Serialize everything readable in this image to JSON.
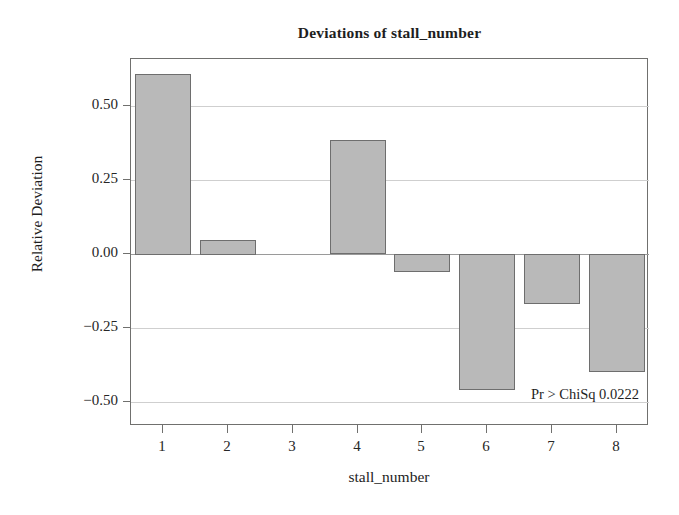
{
  "chart_data": {
    "type": "bar",
    "title": "Deviations of stall_number",
    "xlabel": "stall_number",
    "ylabel": "Relative Deviation",
    "categories": [
      "1",
      "2",
      "3",
      "4",
      "5",
      "6",
      "7",
      "8"
    ],
    "values": [
      0.61,
      0.05,
      0.0,
      0.385,
      -0.06,
      -0.46,
      -0.17,
      -0.4
    ],
    "ylim": [
      -0.58,
      0.66
    ],
    "yticks": [
      0.5,
      0.25,
      0.0,
      -0.25,
      -0.5
    ],
    "ytick_labels": [
      "0.50",
      "0.25",
      "0.00",
      "−0.25",
      "−0.50"
    ],
    "grid": true,
    "legend": "none",
    "annotations": [
      {
        "text": "Pr > ChiSq 0.0222",
        "x": 8,
        "y": -0.5,
        "align": "right"
      }
    ],
    "bar_fill_color": "#b9b9b9",
    "bar_edge_color": "#6e6e6e",
    "grid_color": "#cfcfcf",
    "zero_line_color": "#9a9a9a",
    "frame_color": "#70706e",
    "background_color": "#ffffff"
  },
  "figure": {
    "title": "Deviations of stall_number",
    "x_axis_title": "stall_number",
    "y_axis_title": "Relative Deviation",
    "annotation": "Pr > ChiSq 0.0222"
  }
}
